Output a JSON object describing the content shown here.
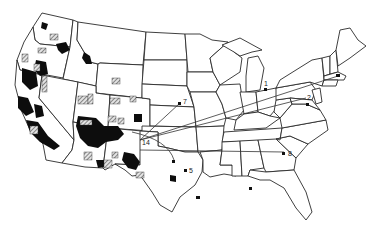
{
  "map": {
    "title": "",
    "region": "Continental United States",
    "legend_visible": false,
    "colors": {
      "background": "#ffffff",
      "state_outline": "#2a2a2a",
      "solid_areas": "#0d0d0d",
      "hatched_areas": "#555555"
    },
    "area_types": [
      {
        "name": "solid-black-areas",
        "style": "solid"
      },
      {
        "name": "hatched-areas",
        "style": "crosshatch"
      }
    ],
    "hub": {
      "label": "14",
      "location": "Four Corners region (AZ/NM/UT/CO)"
    },
    "sites": [
      {
        "label": "1",
        "location": "Michigan / Ohio"
      },
      {
        "label": "2",
        "location": "Maryland / Pennsylvania"
      },
      {
        "label": "5",
        "location": "Texas"
      },
      {
        "label": "7",
        "location": "Kansas"
      },
      {
        "label": "8",
        "location": "Georgia / South Carolina"
      }
    ],
    "routes": [
      {
        "from": "14",
        "to": "7"
      },
      {
        "from": "14",
        "to": "2"
      },
      {
        "from": "14",
        "to": "Massachusetts site"
      },
      {
        "from": "14",
        "to": "8"
      },
      {
        "from": "14",
        "to": "Oklahoma/Texas site"
      }
    ],
    "footnote": ""
  }
}
